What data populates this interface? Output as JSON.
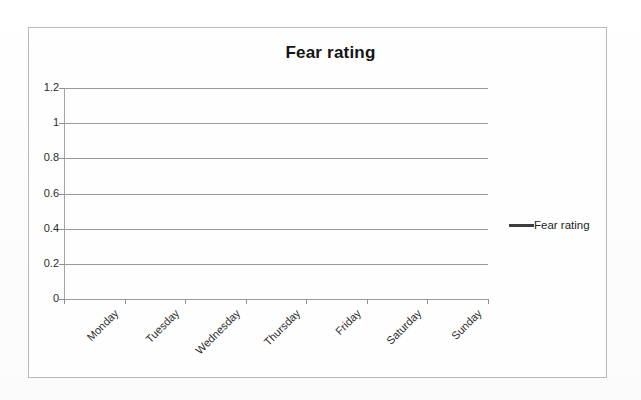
{
  "chart_data": {
    "type": "line",
    "title": "Fear rating",
    "xlabel": "",
    "ylabel": "",
    "categories": [
      "Monday",
      "Tuesday",
      "Wednesday",
      "Thursday",
      "Friday",
      "Saturday",
      "Sunday"
    ],
    "series": [
      {
        "name": "Fear rating",
        "values": [
          null,
          null,
          null,
          null,
          null,
          null,
          null
        ],
        "color": "#3d3d3d"
      }
    ],
    "ylim": [
      0,
      1.2
    ],
    "ytick_labels": [
      "0",
      "0.2",
      "0.4",
      "0.6",
      "0.8",
      "1",
      "1.2"
    ],
    "ytick_values": [
      0,
      0.2,
      0.4,
      0.6,
      0.8,
      1,
      1.2
    ],
    "grid": "horizontal",
    "legend_position": "right",
    "legend_entries": [
      "Fear rating"
    ],
    "plot_background": "#fefefe",
    "gridline_color": "#9a9a9a",
    "frame_color": "#b9b9b9"
  },
  "legend": {
    "entry_label": "Fear rating"
  }
}
